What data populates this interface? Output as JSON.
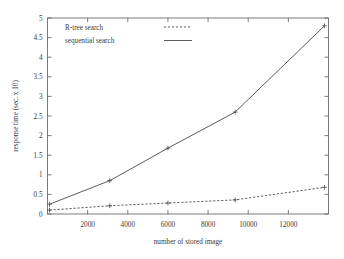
{
  "chart_data": {
    "type": "line",
    "title": "",
    "xlabel": "number of stored image",
    "ylabel": "response time (sec. x 10)",
    "xlim": [
      0,
      14000
    ],
    "ylim": [
      0,
      5
    ],
    "xticks": [
      2000,
      4000,
      6000,
      8000,
      10000,
      12000
    ],
    "xticklabels": [
      "2000",
      "4000",
      "6000",
      "8000",
      "10000",
      "12000"
    ],
    "yticks": [
      0,
      0.5,
      1,
      1.5,
      2,
      2.5,
      3,
      3.5,
      4,
      4.5,
      5
    ],
    "yticklabels": [
      "0",
      "0.5",
      "1",
      "1.5",
      "2",
      "2.5",
      "3",
      "3.5",
      "4",
      "4.5",
      "5"
    ],
    "grid": false,
    "legend_position": "top-left",
    "x": [
      100,
      3100,
      6000,
      9350,
      13800
    ],
    "series": [
      {
        "name": "R-tree search",
        "style": "dashed",
        "marker": "plus",
        "values": [
          0.1,
          0.21,
          0.28,
          0.36,
          0.68
        ]
      },
      {
        "name": "sequential search",
        "style": "solid",
        "marker": "plus",
        "values": [
          0.25,
          0.85,
          1.68,
          2.6,
          4.8
        ]
      }
    ]
  },
  "legend": {
    "entries": [
      {
        "label": "R-tree search",
        "style": "dashed"
      },
      {
        "label": "sequential search",
        "style": "solid"
      }
    ]
  }
}
